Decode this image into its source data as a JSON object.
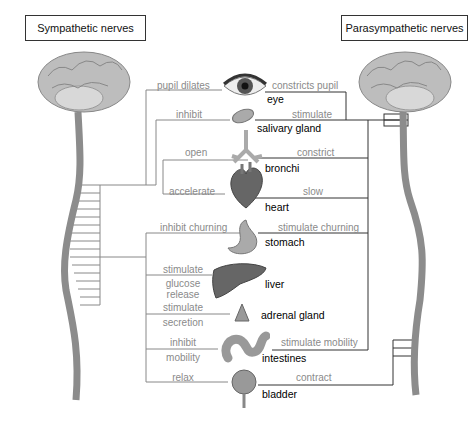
{
  "title_left": "Sympathetic nerves",
  "title_right": "Parasympathetic nerves",
  "organs": [
    {
      "name": "eye",
      "sympathetic": "pupil dilates",
      "parasympathetic": "constricts pupil"
    },
    {
      "name": "salivary gland",
      "sympathetic": "inhibit",
      "parasympathetic": "stimulate"
    },
    {
      "name": "bronchi",
      "sympathetic": "open",
      "parasympathetic": "constrict"
    },
    {
      "name": "heart",
      "sympathetic": "accelerate",
      "parasympathetic": "slow"
    },
    {
      "name": "stomach",
      "sympathetic": "inhibit churning",
      "parasympathetic": "stimulate churning"
    },
    {
      "name": "liver",
      "sympathetic_line1": "stimulate",
      "sympathetic_line2": "glucose",
      "sympathetic_line3": "release"
    },
    {
      "name": "adrenal gland",
      "sympathetic_line1": "stimulate",
      "sympathetic_line2": "secretion"
    },
    {
      "name": "intestines",
      "sympathetic_line1": "inhibit",
      "sympathetic_line2": "mobility",
      "parasympathetic": "stimulate mobility"
    },
    {
      "name": "bladder",
      "sympathetic": "relax",
      "parasympathetic": "contract"
    }
  ]
}
